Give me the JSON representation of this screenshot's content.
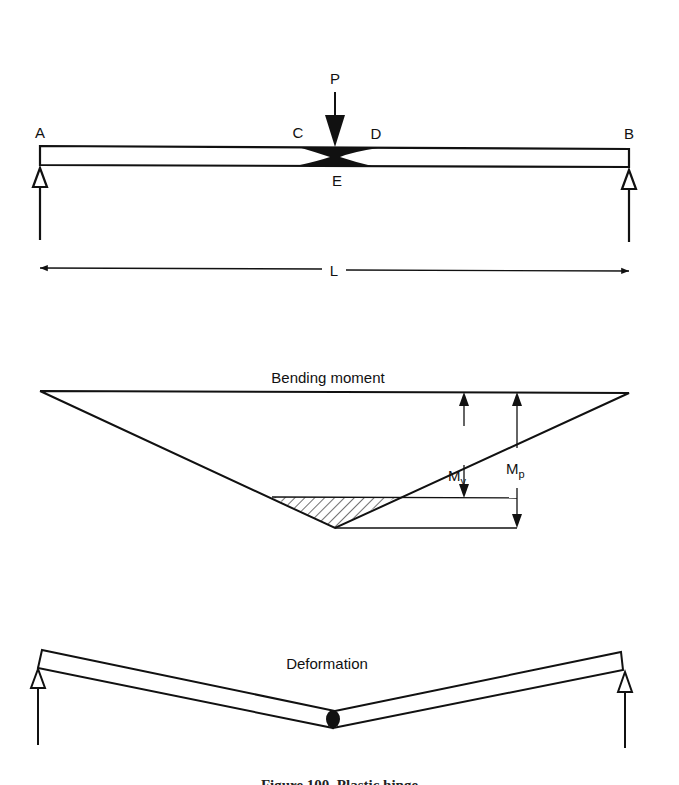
{
  "figure": {
    "caption": "Figure 100. Plastic hinge"
  },
  "beam_diagram": {
    "load_label": "P",
    "support_left_label": "A",
    "support_right_label": "B",
    "hinge_left_label": "C",
    "hinge_right_label": "D",
    "hinge_bottom_label": "E",
    "span_label": "L"
  },
  "moment_diagram": {
    "title": "Bending moment",
    "yield_moment_label": "M",
    "yield_moment_subscript": "y",
    "plastic_moment_label": "M",
    "plastic_moment_subscript": "p"
  },
  "deformation_diagram": {
    "title": "Deformation"
  },
  "colors": {
    "ink": "#111111",
    "background": "#ffffff"
  }
}
